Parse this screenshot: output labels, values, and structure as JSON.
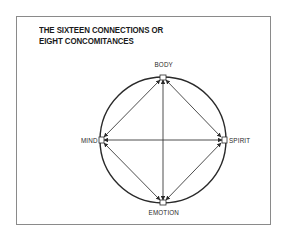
{
  "diagram": {
    "title_lines": [
      "THE SIXTEEN CONNECTIONS OR",
      "EIGHT CONCOMITANCES"
    ],
    "nodes": {
      "top": "BODY",
      "left": "MIND",
      "right": "SPIRIT",
      "bottom": "EMOTION"
    },
    "connections": [
      {
        "from": "BODY",
        "to": "SPIRIT",
        "bidirectional": true
      },
      {
        "from": "SPIRIT",
        "to": "EMOTION",
        "bidirectional": true
      },
      {
        "from": "EMOTION",
        "to": "MIND",
        "bidirectional": true
      },
      {
        "from": "MIND",
        "to": "BODY",
        "bidirectional": true
      },
      {
        "from": "BODY",
        "to": "EMOTION",
        "bidirectional": true
      },
      {
        "from": "MIND",
        "to": "SPIRIT",
        "bidirectional": true
      }
    ],
    "colors": {
      "line": "#3a3a3a",
      "circle": "#2a2a2a",
      "frame": "#8a8a8a",
      "text": "#1a1a1a"
    }
  }
}
